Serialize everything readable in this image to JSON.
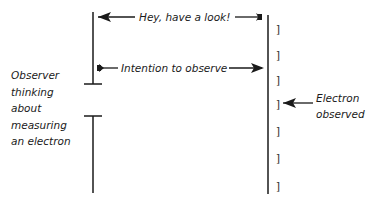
{
  "diagram": {
    "observer_label": [
      "Observer",
      "thinking",
      "about",
      "measuring",
      "an electron"
    ],
    "messages": {
      "look": "Hey, have a look!",
      "intention": "Intention to observe",
      "observed": [
        "Electron",
        "observed"
      ]
    },
    "bracket_glyph": "]",
    "bracket_count": 7,
    "colors": {
      "line": "#1a1a1a",
      "text": "#1a1a1a",
      "background": "#ffffff"
    }
  }
}
